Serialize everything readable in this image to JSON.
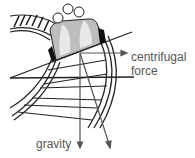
{
  "diagram": {
    "labels": {
      "centrifugal_line1": "centrifugal",
      "centrifugal_line2": "force",
      "gravity": "gravity"
    },
    "colors": {
      "line": "#222222",
      "arrow": "#555555",
      "car_body": "#bdbdbd",
      "car_highlight": "#e8e8e8",
      "label": "#555555"
    }
  }
}
